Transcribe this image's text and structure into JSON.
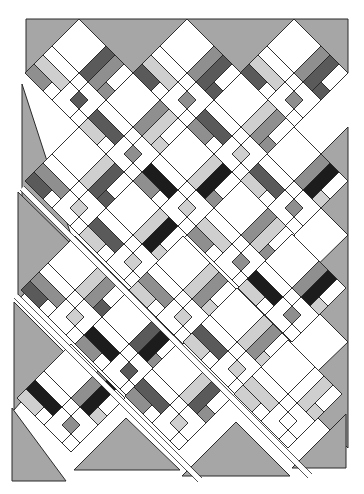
{
  "canvas": {
    "width": 364,
    "height": 494
  },
  "colors": {
    "background": "#ffffff",
    "setting_triangle": "#a6a6a6",
    "outline": "#2a2a2a",
    "white": "#ffffff",
    "light": "#cfcfcf",
    "medium": "#8f8f8f",
    "dark": "#5a5a5a",
    "black": "#1c1c1c"
  },
  "layout": {
    "block_half_diagonal": 54,
    "strips": [
      {
        "name": "strip-1",
        "offset_x": 0,
        "offset_y": 0,
        "clip": [
          [
            26,
            19
          ],
          [
            348,
            19
          ],
          [
            348,
            300
          ],
          [
            26,
            19
          ]
        ]
      },
      {
        "name": "strip-2",
        "offset_x": -4,
        "offset_y": 6,
        "clip": []
      },
      {
        "name": "strip-3",
        "offset_x": -8,
        "offset_y": 12,
        "clip": []
      }
    ],
    "blocks": [
      {
        "cx": 79,
        "cy": 73,
        "palette": [
          "medium",
          "dark",
          "light",
          "medium"
        ]
      },
      {
        "cx": 187,
        "cy": 73,
        "palette": [
          "dark",
          "medium",
          "light",
          "dark"
        ]
      },
      {
        "cx": 294,
        "cy": 73,
        "palette": [
          "dark",
          "medium",
          "light",
          "dark"
        ]
      },
      {
        "cx": 133,
        "cy": 127,
        "palette": [
          "light",
          "medium",
          "dark",
          "light"
        ]
      },
      {
        "cx": 241,
        "cy": 127,
        "palette": [
          "medium",
          "light",
          "dark",
          "medium"
        ]
      },
      {
        "cx": 79,
        "cy": 181,
        "palette": [
          "dark",
          "light",
          "medium",
          "dark"
        ]
      },
      {
        "cx": 187,
        "cy": 181,
        "palette": [
          "black",
          "light",
          "black",
          "medium"
        ]
      },
      {
        "cx": 294,
        "cy": 181,
        "palette": [
          "black",
          "medium",
          "dark",
          "light"
        ]
      },
      {
        "cx": 133,
        "cy": 235,
        "palette": [
          "black",
          "light",
          "dark",
          "light"
        ]
      },
      {
        "cx": 241,
        "cy": 235,
        "palette": [
          "light",
          "medium",
          "light",
          "medium"
        ]
      },
      {
        "cx": 75,
        "cy": 290,
        "palette": [
          "medium",
          "light",
          "medium",
          "dark"
        ]
      },
      {
        "cx": 183,
        "cy": 290,
        "palette": [
          "medium",
          "light",
          "medium",
          "light"
        ]
      },
      {
        "cx": 292,
        "cy": 288,
        "palette": [
          "black",
          "medium",
          "black",
          "light"
        ]
      },
      {
        "cx": 129,
        "cy": 344,
        "palette": [
          "black",
          "dark",
          "black",
          "medium"
        ]
      },
      {
        "cx": 237,
        "cy": 342,
        "palette": [
          "medium",
          "light",
          "dark",
          "light"
        ]
      },
      {
        "cx": 71,
        "cy": 398,
        "palette": [
          "black",
          "medium",
          "black",
          "light"
        ]
      },
      {
        "cx": 179,
        "cy": 396,
        "palette": [
          "dark",
          "light",
          "dark",
          "medium"
        ]
      },
      {
        "cx": 288,
        "cy": 394,
        "palette": [
          "light",
          "white",
          "light",
          "light"
        ]
      }
    ],
    "triangles": [
      {
        "points": "26,19 79,19 26,73"
      },
      {
        "points": "79,19 187,19 133,73"
      },
      {
        "points": "187,19 294,19 241,73"
      },
      {
        "points": "294,19 348,19 348,73"
      },
      {
        "points": "348,127 348,235 294,181"
      },
      {
        "points": "348,235 348,342 294,288"
      },
      {
        "points": "348,342 348,448 294,394"
      },
      {
        "points": "22,84 22,296 72,238"
      },
      {
        "points": "18,192 18,300 71,244"
      },
      {
        "points": "14,302 14,410 64,352"
      },
      {
        "points": "12,408 12,481 66,481"
      },
      {
        "points": "74,470 126,418 180,470"
      },
      {
        "points": "182,476 236,422 290,476"
      },
      {
        "points": "292,468 346,414 346,468"
      }
    ],
    "sashing": [
      {
        "x1": 22,
        "y1": 188,
        "x2": 310,
        "y2": 476
      },
      {
        "x1": 16,
        "y1": 296,
        "x2": 200,
        "y2": 480
      }
    ]
  }
}
